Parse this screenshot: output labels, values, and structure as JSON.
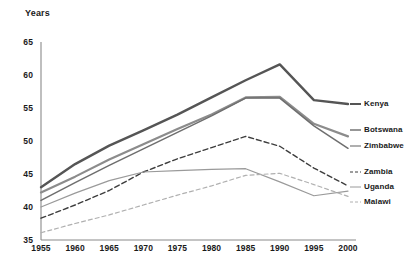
{
  "chart_data": {
    "type": "line",
    "title": "",
    "ylabel": "Years",
    "xlabel": "",
    "x": [
      1955,
      1960,
      1965,
      1970,
      1975,
      1980,
      1985,
      1990,
      1995,
      2000
    ],
    "ylim": [
      35,
      65
    ],
    "xlim": [
      1955,
      2000
    ],
    "yticks": [
      35,
      40,
      45,
      50,
      55,
      60,
      65
    ],
    "xticks": [
      "1955",
      "1960",
      "1965",
      "1970",
      "1975",
      "1980",
      "1985",
      "1990",
      "1995",
      "2000"
    ],
    "grid": false,
    "legend_position": "right",
    "series": [
      {
        "name": "Kenya",
        "color": "#555555",
        "width": 2.4,
        "dash": "none",
        "values": [
          43.0,
          46.5,
          49.3,
          51.6,
          54.0,
          56.6,
          59.2,
          61.6,
          56.2,
          55.6
        ]
      },
      {
        "name": "Botswana",
        "color": "#8c8c8c",
        "width": 2.2,
        "dash": "none",
        "values": [
          42.2,
          44.6,
          47.2,
          49.5,
          51.8,
          54.0,
          56.6,
          56.7,
          52.6,
          50.7
        ]
      },
      {
        "name": "Zimbabwe",
        "color": "#6e6e6e",
        "width": 1.5,
        "dash": "none",
        "values": [
          41.0,
          43.7,
          46.3,
          48.8,
          51.3,
          53.8,
          56.5,
          56.5,
          52.3,
          48.9
        ]
      },
      {
        "name": "Zambia",
        "color": "#3d3d3d",
        "width": 1.4,
        "dash": "5,3",
        "values": [
          38.3,
          40.3,
          42.5,
          45.3,
          47.3,
          49.0,
          50.7,
          49.2,
          45.9,
          43.2
        ]
      },
      {
        "name": "Uganda",
        "color": "#9a9a9a",
        "width": 1.2,
        "dash": "none",
        "values": [
          40.0,
          42.1,
          44.0,
          45.3,
          45.5,
          45.7,
          45.8,
          43.8,
          41.7,
          42.4
        ]
      },
      {
        "name": "Malawi",
        "color": "#b0b0b0",
        "width": 1.2,
        "dash": "4,3",
        "values": [
          36.1,
          37.5,
          38.8,
          40.3,
          41.8,
          43.2,
          44.8,
          45.1,
          43.4,
          41.6
        ]
      }
    ]
  },
  "legend": {
    "entries": [
      {
        "label": "Kenya"
      },
      {
        "label": "Botswana"
      },
      {
        "label": "Zimbabwe"
      },
      {
        "label": "Zambia"
      },
      {
        "label": "Uganda"
      },
      {
        "label": "Malawi"
      }
    ]
  }
}
